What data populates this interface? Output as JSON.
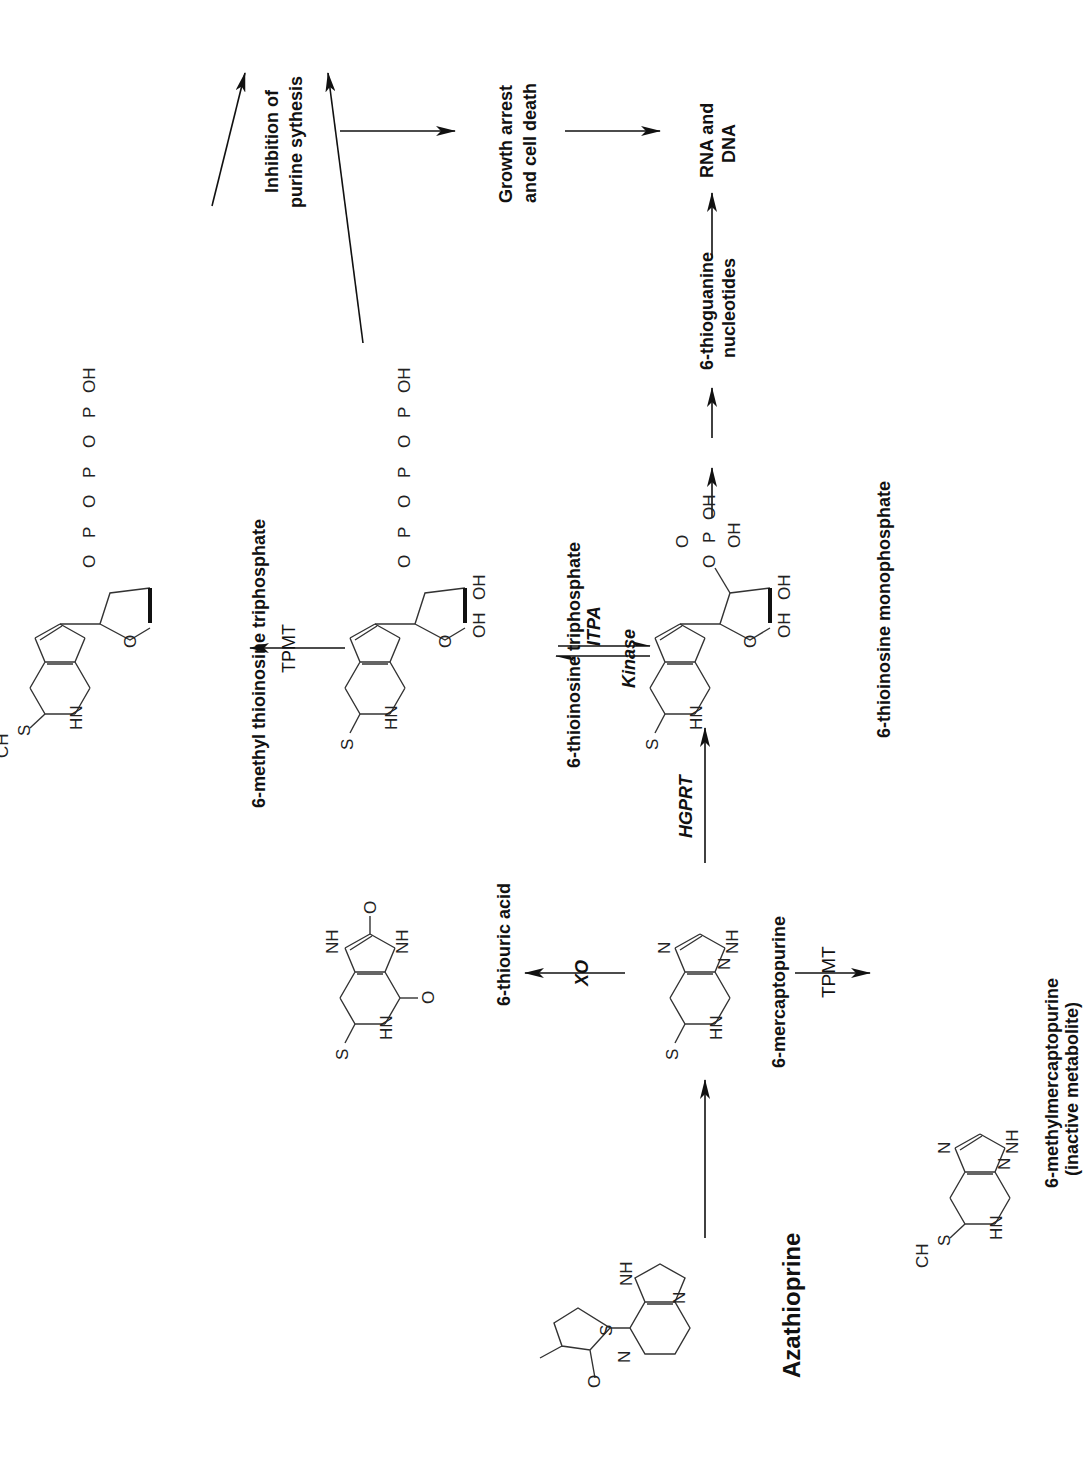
{
  "compounds": {
    "azathioprine": "Azathioprine",
    "mercaptopurine": "6-mercaptopurine",
    "thiouric_acid": "6-thiouric acid",
    "methylmercaptopurine_line1": "6-methylmercaptopurine",
    "methylmercaptopurine_line2": "(inactive metabolite)",
    "timp": "6-thioinosine monophosphate",
    "titp": "6-thioinosine triphosphate",
    "methyl_titp": "6-methyl thioinosine triphosphate",
    "tgn_line1": "6-thioguanine",
    "tgn_line2": "nucleotides",
    "rna_dna_line1": "RNA and",
    "rna_dna_line2": "DNA",
    "inhibition_line1": "Inhibition of",
    "inhibition_line2": "purine sythesis",
    "growth_line1": "Growth arrest",
    "growth_line2": "and cell death"
  },
  "enzymes": {
    "xo": "XO",
    "hgprt": "HGPRT",
    "tpmt_lower": "TPMT",
    "tpmt_upper": "TPMT",
    "kinase": "Kinase",
    "itpa": "ITPA"
  },
  "atoms": {
    "S": "S",
    "N": "N",
    "HN": "HN",
    "NH": "NH",
    "O": "O",
    "H": "H",
    "OH": "OH",
    "HO": "HO",
    "P": "P",
    "CH3": "CH",
    "sub3": "3",
    "nplus": "+",
    "ominus": "-"
  }
}
